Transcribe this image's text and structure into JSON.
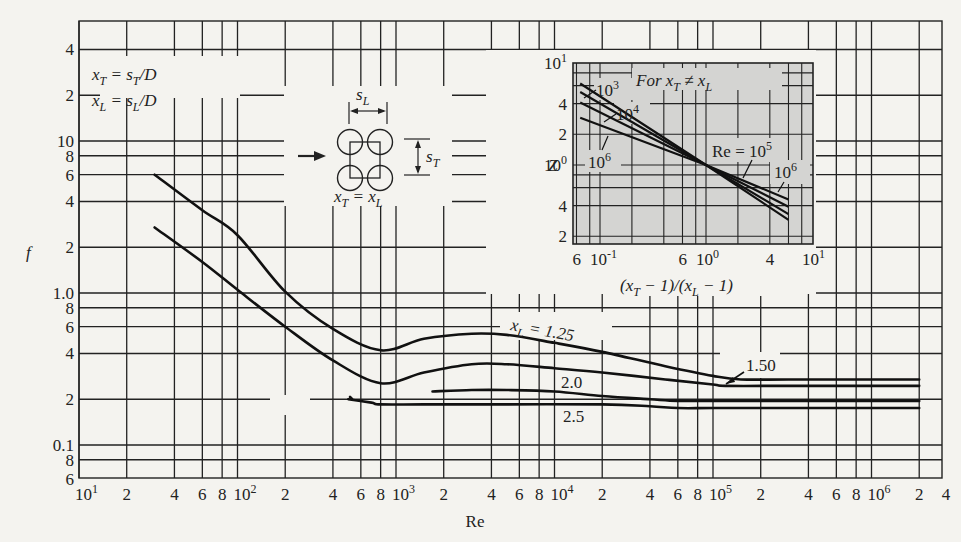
{
  "chart_data": [
    {
      "type": "line",
      "title": "",
      "xlabel": "Re",
      "ylabel": "f",
      "x_scale": "log",
      "y_scale": "log",
      "xlim": [
        10,
        4000000
      ],
      "ylim": [
        0.06,
        50
      ],
      "grid": true,
      "x_tick_labels": [
        "10^1",
        "2",
        "4",
        "6",
        "8",
        "10^2",
        "2",
        "4",
        "6",
        "8",
        "10^3",
        "2",
        "4",
        "6",
        "8",
        "10^4",
        "2",
        "4",
        "6",
        "8",
        "10^5",
        "2",
        "4",
        "6",
        "8",
        "10^6",
        "2",
        "4"
      ],
      "y_tick_labels": [
        "4",
        "2",
        "10",
        "8",
        "6",
        "4",
        "2",
        "1.0",
        "8",
        "6",
        "4",
        "2",
        "0.1",
        "8",
        "6"
      ],
      "annotations": [
        "x_T = s_T/D",
        "x_L = s_L/D",
        "x_T = x_L",
        "s_L",
        "s_T"
      ],
      "series": [
        {
          "name": "x_L = 1.25",
          "label": "x_L = 1.25",
          "x": [
            30,
            60,
            100,
            200,
            400,
            800,
            1500,
            3000,
            5000,
            10000,
            20000,
            50000,
            100000,
            150000,
            300000,
            1000000,
            2000000
          ],
          "y": [
            6.0,
            3.5,
            2.4,
            1.02,
            0.58,
            0.42,
            0.5,
            0.54,
            0.53,
            0.47,
            0.41,
            0.33,
            0.285,
            0.27,
            0.27,
            0.27,
            0.27
          ]
        },
        {
          "name": "x_L = 1.50",
          "label": "1.50",
          "x": [
            30,
            60,
            100,
            200,
            400,
            800,
            1500,
            3000,
            5000,
            10000,
            20000,
            50000,
            100000,
            120000,
            300000,
            1000000,
            2000000
          ],
          "y": [
            2.7,
            1.6,
            1.05,
            0.6,
            0.36,
            0.255,
            0.3,
            0.34,
            0.34,
            0.32,
            0.3,
            0.27,
            0.25,
            0.245,
            0.245,
            0.245,
            0.245
          ]
        },
        {
          "name": "x_L = 2.0",
          "label": "2.0",
          "x": [
            1700,
            3000,
            5000,
            10000,
            20000,
            40000,
            60000,
            100000,
            300000,
            1000000,
            2000000
          ],
          "y": [
            0.225,
            0.23,
            0.23,
            0.225,
            0.21,
            0.2,
            0.195,
            0.195,
            0.195,
            0.195,
            0.195
          ]
        },
        {
          "name": "x_L = 2.5",
          "label": "2.5",
          "x": [
            500,
            700,
            800,
            1500,
            5000,
            20000,
            40000,
            60000,
            100000,
            300000,
            1000000,
            2000000
          ],
          "y": [
            0.2,
            0.19,
            0.185,
            0.185,
            0.185,
            0.185,
            0.18,
            0.175,
            0.175,
            0.175,
            0.175,
            0.175
          ]
        }
      ]
    },
    {
      "type": "line",
      "title": "For x_T ≠ x_L",
      "xlabel": "(x_T − 1)/(x_L − 1)",
      "ylabel": "Z",
      "x_scale": "log",
      "y_scale": "log",
      "xlim": [
        0.06,
        10
      ],
      "ylim": [
        0.18,
        10
      ],
      "grid": true,
      "background": "#d4d4d2",
      "x_tick_labels": [
        "6",
        "10^-1",
        "6",
        "10^0",
        "4",
        "10^1"
      ],
      "y_tick_labels": [
        "10^1",
        "4",
        "2",
        "10^0",
        "4",
        "2"
      ],
      "series": [
        {
          "name": "Re = 10^3",
          "label": "10^3",
          "x": [
            0.065,
            1.0,
            6.0
          ],
          "y": [
            6.3,
            1.0,
            0.29
          ]
        },
        {
          "name": "Re = 10^4",
          "label": "10^4",
          "x": [
            0.065,
            1.0,
            6.0
          ],
          "y": [
            5.2,
            1.0,
            0.33
          ]
        },
        {
          "name": "Re = 10^5",
          "label": "Re = 10^5",
          "x": [
            0.065,
            1.0,
            6.0
          ],
          "y": [
            4.1,
            1.0,
            0.39
          ]
        },
        {
          "name": "Re = 10^6",
          "label": "10^6",
          "x": [
            0.065,
            1.0,
            6.0
          ],
          "y": [
            2.9,
            1.0,
            0.46
          ]
        }
      ]
    }
  ],
  "labels": {
    "x_axis": "Re",
    "y_axis": "f",
    "def_xt": "x_T = s_T/D",
    "def_xl": "x_L = s_L/D",
    "diagram_eq": "x_T = x_L",
    "inset_title": "For x_T ≠ x_L",
    "inset_xlabel": "(x_T − 1)/(x_L − 1)",
    "inset_ylabel": "Z"
  }
}
